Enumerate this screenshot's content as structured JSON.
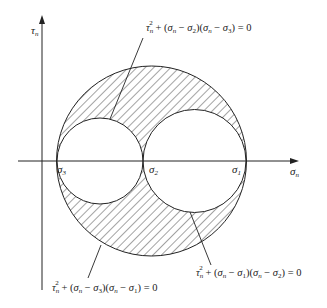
{
  "figure": {
    "axes": {
      "y_label": {
        "base": "τ",
        "sub": "n"
      },
      "x_label": {
        "base": "σ",
        "sub": "n"
      }
    },
    "points": [
      {
        "base": "σ",
        "sub": "3"
      },
      {
        "base": "σ",
        "sub": "2"
      },
      {
        "base": "σ",
        "sub": "1"
      }
    ],
    "equations": {
      "top": {
        "parts": [
          "τ",
          "n",
          "2",
          " + (",
          "σ",
          "n",
          " − ",
          "σ",
          "2",
          ")(",
          "σ",
          "n",
          " − ",
          "σ",
          "3",
          ") = 0"
        ]
      },
      "bottom_left": {
        "parts": [
          "τ",
          "n",
          "2",
          " + (",
          "σ",
          "n",
          " − ",
          "σ",
          "3",
          ")(",
          "σ",
          "n",
          " − ",
          "σ",
          "1",
          ") = 0"
        ]
      },
      "bottom_right": {
        "parts": [
          "τ",
          "n",
          "2",
          " + (",
          "σ",
          "n",
          " − ",
          "σ",
          "1",
          ")(",
          "σ",
          "n",
          " − ",
          "σ",
          "2",
          ") = 0"
        ]
      }
    },
    "colors": {
      "stroke": "#222222",
      "hatch": "#333333",
      "background": "#ffffff"
    }
  }
}
